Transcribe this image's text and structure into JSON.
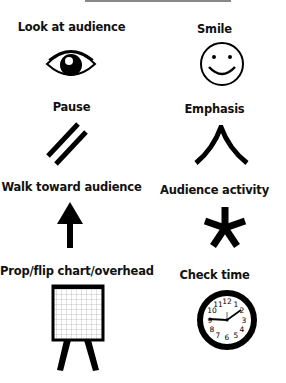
{
  "items": [
    {
      "label": "Look at audience",
      "icon": "eye-icon"
    },
    {
      "label": "Smile",
      "icon": "smiley-face-icon"
    },
    {
      "label": "Pause",
      "icon": "double-slash-icon"
    },
    {
      "label": "Emphasis",
      "icon": "caret-up-icon"
    },
    {
      "label": "Walk toward audience",
      "icon": "arrow-up-icon"
    },
    {
      "label": "Audience activity",
      "icon": "asterisk-icon"
    },
    {
      "label": "Prop/flip chart/overhead",
      "icon": "flip-chart-icon"
    },
    {
      "label": "Check time",
      "icon": "clock-icon"
    }
  ],
  "clock_numbers": [
    "12",
    "1",
    "2",
    "3",
    "4",
    "5",
    "6",
    "7",
    "8",
    "9",
    "10",
    "11"
  ]
}
